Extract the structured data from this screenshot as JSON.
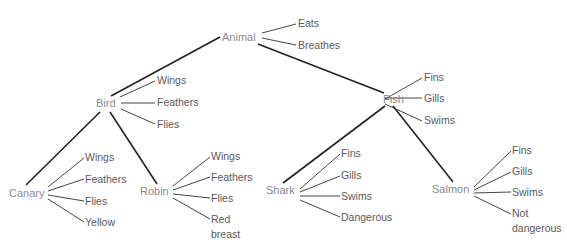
{
  "diagram": {
    "type": "semantic-network-hierarchy",
    "root": {
      "label": "Animal",
      "properties": [
        "Eats",
        "Breathes"
      ],
      "children": [
        {
          "label": "Bird",
          "properties": [
            "Wings",
            "Feathers",
            "Flies"
          ],
          "children": [
            {
              "label": "Canary",
              "properties": [
                "Wings",
                "Feathers",
                "Flies",
                "Yellow"
              ]
            },
            {
              "label": "Robin",
              "properties": [
                "Wings",
                "Feathers",
                "Flies",
                "Red breast"
              ]
            }
          ]
        },
        {
          "label": "Fish",
          "properties": [
            "Fins",
            "Gills",
            "Swims"
          ],
          "children": [
            {
              "label": "Shark",
              "properties": [
                "Fins",
                "Gills",
                "Swims",
                "Dangerous"
              ]
            },
            {
              "label": "Salmon",
              "properties": [
                "Fins",
                "Gills",
                "Swims",
                "Not dangerous"
              ]
            }
          ]
        }
      ]
    },
    "labels": {
      "animal": "Animal",
      "animal_p0": "Eats",
      "animal_p1": "Breathes",
      "bird": "Bird",
      "bird_p0": "Wings",
      "bird_p1": "Feathers",
      "bird_p2": "Flies",
      "fish": "Fish",
      "fish_p0": "Fins",
      "fish_p1": "Gills",
      "fish_p2": "Swims",
      "canary": "Canary",
      "canary_p0": "Wings",
      "canary_p1": "Feathers",
      "canary_p2": "Flies",
      "canary_p3": "Yellow",
      "robin": "Robin",
      "robin_p0": "Wings",
      "robin_p1": "Feathers",
      "robin_p2": "Flies",
      "robin_p3a": "Red",
      "robin_p3b": "breast",
      "shark": "Shark",
      "shark_p0": "Fins",
      "shark_p1": "Gills",
      "shark_p2": "Swims",
      "shark_p3": "Dangerous",
      "salmon": "Salmon",
      "salmon_p0": "Fins",
      "salmon_p1": "Gills",
      "salmon_p2": "Swims",
      "salmon_p3a": "Not",
      "salmon_p3b": "dangerous"
    },
    "colors": {
      "hierarchy_line": "#222222",
      "property_line": "#444444",
      "node_text": "#8a8a8a",
      "property_text": "#5a5a5a"
    }
  }
}
